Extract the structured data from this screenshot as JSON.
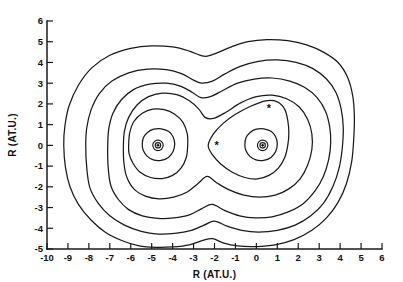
{
  "figure": {
    "title": "",
    "background_color": "#ffffff",
    "line_color": "#1a1a1a"
  },
  "axes": {
    "x": {
      "label": "R (AT.U.)",
      "min": -10,
      "max": 6,
      "ticks": [
        -10,
        -9,
        -8,
        -7,
        -6,
        -5,
        -4,
        -3,
        -2,
        -1,
        0,
        1,
        2,
        3,
        4,
        5,
        6
      ],
      "tick_labels": [
        "-10",
        "-9",
        "-8",
        "-7",
        "-6",
        "-5",
        "-4",
        "-3",
        "-2",
        "-1",
        "0",
        "1",
        "2",
        "3",
        "4",
        "5",
        "6"
      ]
    },
    "y": {
      "label": "R (AT.U.)",
      "min": -5,
      "max": 6,
      "ticks": [
        -5,
        -4,
        -3,
        -2,
        -1,
        0,
        1,
        2,
        3,
        4,
        5,
        6
      ],
      "tick_labels": [
        "-5",
        "-4",
        "-3",
        "-2",
        "-1",
        "0",
        "1",
        "2",
        "3",
        "4",
        "5",
        "6"
      ]
    }
  },
  "chart_data": {
    "type": "line",
    "subtype": "contour",
    "title": "",
    "xlabel": "R (AT.U.)",
    "ylabel": "R (AT.U.)",
    "xlim": [
      -10,
      6
    ],
    "ylim": [
      -5,
      6
    ],
    "grid": false,
    "legend": "none",
    "n_levels": 6,
    "markers": [
      {
        "name": "nucleus-left",
        "symbol": "ringed-dot",
        "x": -4.7,
        "y": 0.0
      },
      {
        "name": "nucleus-right",
        "symbol": "ringed-dot",
        "x": 0.3,
        "y": 0.0
      },
      {
        "name": "critical-point-1",
        "symbol": "*",
        "x": -1.9,
        "y": 0.0
      },
      {
        "name": "critical-point-2",
        "symbol": "*",
        "x": 0.6,
        "y": 1.8
      }
    ],
    "contours": [
      {
        "level_index": 1,
        "name": "outermost",
        "points": [
          [
            -9.2,
            0.0
          ],
          [
            -9.15,
            0.9
          ],
          [
            -8.95,
            1.9
          ],
          [
            -8.5,
            2.9
          ],
          [
            -7.85,
            3.75
          ],
          [
            -7.0,
            4.35
          ],
          [
            -6.0,
            4.68
          ],
          [
            -5.0,
            4.8
          ],
          [
            -4.0,
            4.75
          ],
          [
            -3.2,
            4.55
          ],
          [
            -2.7,
            4.35
          ],
          [
            -2.35,
            4.3
          ],
          [
            -1.9,
            4.45
          ],
          [
            -1.2,
            4.75
          ],
          [
            -0.4,
            5.0
          ],
          [
            0.5,
            5.1
          ],
          [
            1.5,
            5.05
          ],
          [
            2.4,
            4.85
          ],
          [
            3.2,
            4.5
          ],
          [
            3.9,
            4.0
          ],
          [
            4.35,
            3.3
          ],
          [
            4.6,
            2.4
          ],
          [
            4.68,
            1.4
          ],
          [
            4.65,
            0.3
          ],
          [
            4.55,
            -0.8
          ],
          [
            4.3,
            -1.85
          ],
          [
            3.9,
            -2.75
          ],
          [
            3.35,
            -3.5
          ],
          [
            2.65,
            -4.1
          ],
          [
            1.8,
            -4.55
          ],
          [
            0.9,
            -4.8
          ],
          [
            0.0,
            -4.88
          ],
          [
            -0.9,
            -4.85
          ],
          [
            -1.6,
            -4.7
          ],
          [
            -2.1,
            -4.5
          ],
          [
            -2.6,
            -4.6
          ],
          [
            -3.2,
            -4.8
          ],
          [
            -4.0,
            -4.9
          ],
          [
            -4.8,
            -4.92
          ],
          [
            -5.6,
            -4.85
          ],
          [
            -6.4,
            -4.6
          ],
          [
            -7.2,
            -4.2
          ],
          [
            -7.9,
            -3.6
          ],
          [
            -8.5,
            -2.85
          ],
          [
            -8.9,
            -2.0
          ],
          [
            -9.12,
            -1.05
          ],
          [
            -9.2,
            0.0
          ]
        ]
      },
      {
        "level_index": 2,
        "points": [
          [
            -8.15,
            0.0
          ],
          [
            -8.1,
            0.85
          ],
          [
            -7.9,
            1.7
          ],
          [
            -7.5,
            2.5
          ],
          [
            -6.9,
            3.1
          ],
          [
            -6.1,
            3.5
          ],
          [
            -5.2,
            3.68
          ],
          [
            -4.3,
            3.65
          ],
          [
            -3.55,
            3.45
          ],
          [
            -3.0,
            3.15
          ],
          [
            -2.6,
            3.0
          ],
          [
            -2.1,
            3.1
          ],
          [
            -1.5,
            3.45
          ],
          [
            -0.8,
            3.8
          ],
          [
            0.1,
            4.05
          ],
          [
            1.0,
            4.12
          ],
          [
            1.9,
            4.0
          ],
          [
            2.7,
            3.7
          ],
          [
            3.35,
            3.2
          ],
          [
            3.8,
            2.55
          ],
          [
            4.05,
            1.75
          ],
          [
            4.15,
            0.85
          ],
          [
            4.1,
            -0.15
          ],
          [
            3.95,
            -1.1
          ],
          [
            3.65,
            -2.0
          ],
          [
            3.2,
            -2.8
          ],
          [
            2.6,
            -3.4
          ],
          [
            1.85,
            -3.85
          ],
          [
            1.0,
            -4.1
          ],
          [
            0.1,
            -4.18
          ],
          [
            -0.7,
            -4.1
          ],
          [
            -1.4,
            -3.9
          ],
          [
            -2.0,
            -3.65
          ],
          [
            -2.5,
            -3.85
          ],
          [
            -3.1,
            -4.1
          ],
          [
            -3.9,
            -4.25
          ],
          [
            -4.7,
            -4.28
          ],
          [
            -5.5,
            -4.15
          ],
          [
            -6.3,
            -3.85
          ],
          [
            -7.0,
            -3.4
          ],
          [
            -7.55,
            -2.8
          ],
          [
            -7.95,
            -2.05
          ],
          [
            -8.1,
            -1.1
          ],
          [
            -8.15,
            0.0
          ]
        ]
      },
      {
        "level_index": 3,
        "points": [
          [
            -7.1,
            0.0
          ],
          [
            -7.05,
            0.8
          ],
          [
            -6.85,
            1.55
          ],
          [
            -6.45,
            2.2
          ],
          [
            -5.85,
            2.7
          ],
          [
            -5.1,
            2.95
          ],
          [
            -4.3,
            3.0
          ],
          [
            -3.6,
            2.85
          ],
          [
            -3.05,
            2.55
          ],
          [
            -2.65,
            2.3
          ],
          [
            -2.2,
            2.35
          ],
          [
            -1.6,
            2.65
          ],
          [
            -0.9,
            3.0
          ],
          [
            -0.1,
            3.2
          ],
          [
            0.75,
            3.25
          ],
          [
            1.6,
            3.1
          ],
          [
            2.3,
            2.8
          ],
          [
            2.9,
            2.3
          ],
          [
            3.3,
            1.65
          ],
          [
            3.5,
            0.9
          ],
          [
            3.55,
            0.1
          ],
          [
            3.45,
            -0.7
          ],
          [
            3.2,
            -1.5
          ],
          [
            2.8,
            -2.2
          ],
          [
            2.25,
            -2.8
          ],
          [
            1.55,
            -3.2
          ],
          [
            0.75,
            -3.45
          ],
          [
            -0.05,
            -3.5
          ],
          [
            -0.8,
            -3.4
          ],
          [
            -1.5,
            -3.15
          ],
          [
            -2.1,
            -2.85
          ],
          [
            -2.6,
            -3.05
          ],
          [
            -3.2,
            -3.35
          ],
          [
            -3.95,
            -3.5
          ],
          [
            -4.7,
            -3.52
          ],
          [
            -5.45,
            -3.4
          ],
          [
            -6.1,
            -3.1
          ],
          [
            -6.6,
            -2.6
          ],
          [
            -6.95,
            -1.95
          ],
          [
            -7.08,
            -1.05
          ],
          [
            -7.1,
            0.0
          ]
        ]
      },
      {
        "level_index": 4,
        "points": [
          [
            -6.35,
            0.0
          ],
          [
            -6.3,
            0.7
          ],
          [
            -6.1,
            1.35
          ],
          [
            -5.7,
            1.95
          ],
          [
            -5.15,
            2.35
          ],
          [
            -4.5,
            2.52
          ],
          [
            -3.8,
            2.45
          ],
          [
            -3.2,
            2.15
          ],
          [
            -2.75,
            1.75
          ],
          [
            -2.45,
            1.35
          ],
          [
            -2.05,
            1.3
          ],
          [
            -1.45,
            1.6
          ],
          [
            -0.75,
            2.05
          ],
          [
            0.0,
            2.35
          ],
          [
            0.75,
            2.42
          ],
          [
            1.45,
            2.25
          ],
          [
            2.05,
            1.85
          ],
          [
            2.45,
            1.25
          ],
          [
            2.65,
            0.55
          ],
          [
            2.65,
            -0.2
          ],
          [
            2.45,
            -0.95
          ],
          [
            2.1,
            -1.6
          ],
          [
            1.55,
            -2.1
          ],
          [
            0.9,
            -2.4
          ],
          [
            0.15,
            -2.5
          ],
          [
            -0.6,
            -2.4
          ],
          [
            -1.3,
            -2.15
          ],
          [
            -1.9,
            -1.8
          ],
          [
            -2.35,
            -1.5
          ],
          [
            -2.8,
            -1.85
          ],
          [
            -3.3,
            -2.25
          ],
          [
            -3.95,
            -2.5
          ],
          [
            -4.65,
            -2.58
          ],
          [
            -5.3,
            -2.45
          ],
          [
            -5.85,
            -2.1
          ],
          [
            -6.2,
            -1.5
          ],
          [
            -6.33,
            -0.8
          ],
          [
            -6.35,
            0.0
          ]
        ]
      },
      {
        "level_index": 5,
        "name": "separated-left-lobe",
        "points": [
          [
            -6.1,
            0.0
          ],
          [
            -6.05,
            0.6
          ],
          [
            -5.85,
            1.15
          ],
          [
            -5.45,
            1.55
          ],
          [
            -4.95,
            1.75
          ],
          [
            -4.4,
            1.72
          ],
          [
            -3.9,
            1.5
          ],
          [
            -3.5,
            1.1
          ],
          [
            -3.3,
            0.55
          ],
          [
            -3.28,
            0.0
          ],
          [
            -3.35,
            -0.6
          ],
          [
            -3.6,
            -1.1
          ],
          [
            -4.0,
            -1.45
          ],
          [
            -4.5,
            -1.6
          ],
          [
            -5.05,
            -1.55
          ],
          [
            -5.55,
            -1.3
          ],
          [
            -5.9,
            -0.85
          ],
          [
            -6.08,
            -0.4
          ],
          [
            -6.1,
            0.0
          ]
        ]
      },
      {
        "level_index": 5,
        "name": "separated-right-lobe",
        "points": [
          [
            -2.3,
            0.0
          ],
          [
            -2.05,
            0.55
          ],
          [
            -1.6,
            1.05
          ],
          [
            -1.0,
            1.5
          ],
          [
            -0.25,
            1.9
          ],
          [
            0.45,
            2.15
          ],
          [
            1.0,
            2.1
          ],
          [
            1.35,
            1.75
          ],
          [
            1.5,
            1.2
          ],
          [
            1.55,
            0.6
          ],
          [
            1.5,
            0.0
          ],
          [
            1.35,
            -0.6
          ],
          [
            1.05,
            -1.1
          ],
          [
            0.6,
            -1.45
          ],
          [
            0.05,
            -1.62
          ],
          [
            -0.55,
            -1.55
          ],
          [
            -1.15,
            -1.3
          ],
          [
            -1.7,
            -0.9
          ],
          [
            -2.1,
            -0.45
          ],
          [
            -2.3,
            0.0
          ]
        ]
      },
      {
        "level_index": 6,
        "name": "left-core-ring",
        "points": [
          [
            -5.45,
            0.0
          ],
          [
            -5.4,
            0.35
          ],
          [
            -5.2,
            0.62
          ],
          [
            -4.9,
            0.78
          ],
          [
            -4.55,
            0.8
          ],
          [
            -4.2,
            0.68
          ],
          [
            -3.98,
            0.42
          ],
          [
            -3.9,
            0.08
          ],
          [
            -3.98,
            -0.3
          ],
          [
            -4.2,
            -0.58
          ],
          [
            -4.55,
            -0.72
          ],
          [
            -4.92,
            -0.7
          ],
          [
            -5.22,
            -0.52
          ],
          [
            -5.4,
            -0.25
          ],
          [
            -5.45,
            0.0
          ]
        ]
      },
      {
        "level_index": 6,
        "name": "right-core-ring",
        "points": [
          [
            -0.55,
            0.0
          ],
          [
            -0.5,
            0.35
          ],
          [
            -0.3,
            0.62
          ],
          [
            0.0,
            0.78
          ],
          [
            0.35,
            0.8
          ],
          [
            0.7,
            0.68
          ],
          [
            0.92,
            0.42
          ],
          [
            1.0,
            0.08
          ],
          [
            0.92,
            -0.3
          ],
          [
            0.7,
            -0.58
          ],
          [
            0.35,
            -0.72
          ],
          [
            -0.02,
            -0.7
          ],
          [
            -0.32,
            -0.52
          ],
          [
            -0.5,
            -0.25
          ],
          [
            -0.55,
            0.0
          ]
        ]
      }
    ]
  }
}
